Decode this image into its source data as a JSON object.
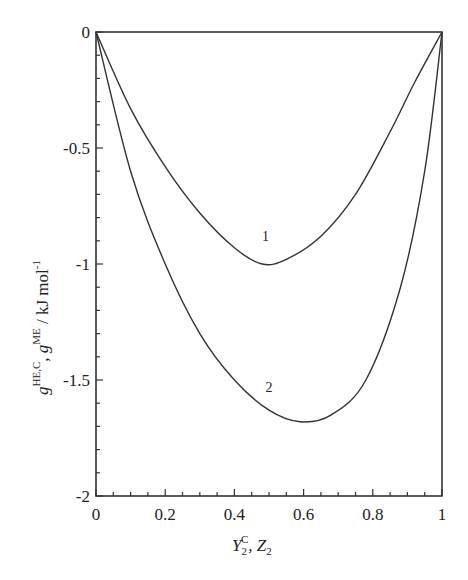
{
  "chart_data": {
    "type": "line",
    "title": "",
    "xlabel": "Y2^C, Z2",
    "ylabel": "g^HE,C, g^ME / kJ mol^-1",
    "xlim": [
      0,
      1
    ],
    "ylim": [
      -2,
      0
    ],
    "grid": false,
    "legend": "none (curves labeled inline as 1 and 2)",
    "x_ticks": [
      "0",
      "0.2",
      "0.4",
      "0.6",
      "0.8",
      "1"
    ],
    "y_ticks": [
      "0",
      "-0.5",
      "-1",
      "-1.5",
      "-2"
    ],
    "series": [
      {
        "name": "1",
        "x": [
          0,
          0.1,
          0.2,
          0.3,
          0.4,
          0.48,
          0.55,
          0.65,
          0.75,
          0.85,
          0.92,
          1
        ],
        "values": [
          0,
          -0.33,
          -0.58,
          -0.78,
          -0.93,
          -1.0,
          -0.98,
          -0.88,
          -0.7,
          -0.43,
          -0.22,
          0
        ],
        "label_pos": [
          0.49,
          -0.9
        ]
      },
      {
        "name": "2",
        "x": [
          0,
          0.1,
          0.2,
          0.3,
          0.4,
          0.5,
          0.59,
          0.68,
          0.78,
          0.88,
          0.95,
          1
        ],
        "values": [
          0,
          -0.6,
          -1.0,
          -1.3,
          -1.5,
          -1.63,
          -1.68,
          -1.65,
          -1.5,
          -1.1,
          -0.6,
          0
        ],
        "label_pos": [
          0.5,
          -1.55
        ]
      }
    ]
  },
  "labels": {
    "xlabel_main": "Y",
    "xlabel_sub": "2",
    "xlabel_sup": "C",
    "xlabel_rest": ", Z",
    "xlabel_rest_sub": "2",
    "ylabel_g1": "g",
    "ylabel_sup1": "HE,C",
    "ylabel_mid": ", g",
    "ylabel_sup2": "ME",
    "ylabel_unit": " / kJ mol",
    "ylabel_unit_sup": "-1"
  }
}
